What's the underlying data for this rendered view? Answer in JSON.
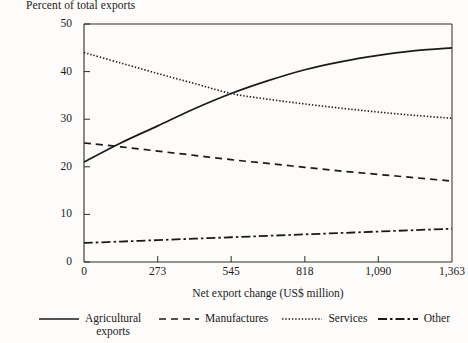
{
  "figure": {
    "y_axis_title": "Percent of total exports",
    "x_axis_title": "Net export change (US$ million)",
    "y_ticks": [
      "0",
      "10",
      "20",
      "30",
      "40",
      "50"
    ],
    "x_ticks": [
      "0",
      "273",
      "545",
      "818",
      "1,090",
      "1,363"
    ],
    "legend": [
      {
        "label": "Agricultural\nexports",
        "style": "solid",
        "icon": "solid-line-icon"
      },
      {
        "label": "Manufactures",
        "style": "dashed",
        "icon": "dashed-line-icon"
      },
      {
        "label": "Services",
        "style": "dotted",
        "icon": "dotted-line-icon"
      },
      {
        "label": "Other",
        "style": "dashdot",
        "icon": "dash-dot-line-icon"
      }
    ],
    "colors": {
      "line": "#1a1a1a",
      "frame": "#2b2b2b",
      "background": "#fdfcfa"
    }
  },
  "chart_data": {
    "type": "line",
    "title": "",
    "xlabel": "Net export change (US$ million)",
    "ylabel": "Percent of total exports",
    "xlim": [
      0,
      1363
    ],
    "ylim": [
      0,
      50
    ],
    "xticks": [
      0,
      273,
      545,
      818,
      1090,
      1363
    ],
    "yticks": [
      0,
      10,
      20,
      30,
      40,
      50
    ],
    "grid": false,
    "legend_position": "bottom",
    "x": [
      0,
      136,
      273,
      409,
      545,
      682,
      818,
      954,
      1090,
      1227,
      1363
    ],
    "series": [
      {
        "name": "Agricultural exports",
        "style": "solid",
        "values": [
          21.0,
          25.0,
          28.6,
          32.2,
          35.4,
          38.1,
          40.4,
          42.1,
          43.4,
          44.4,
          45.0
        ]
      },
      {
        "name": "Manufactures",
        "style": "dashed",
        "values": [
          25.0,
          24.2,
          23.3,
          22.4,
          21.5,
          20.7,
          19.9,
          19.1,
          18.4,
          17.7,
          17.0
        ]
      },
      {
        "name": "Services",
        "style": "dotted",
        "values": [
          44.0,
          41.8,
          39.6,
          37.5,
          35.4,
          34.2,
          33.2,
          32.3,
          31.5,
          30.8,
          30.2
        ]
      },
      {
        "name": "Other",
        "style": "dashdot",
        "values": [
          4.0,
          4.3,
          4.6,
          4.9,
          5.2,
          5.5,
          5.8,
          6.1,
          6.4,
          6.7,
          7.0
        ]
      }
    ]
  }
}
